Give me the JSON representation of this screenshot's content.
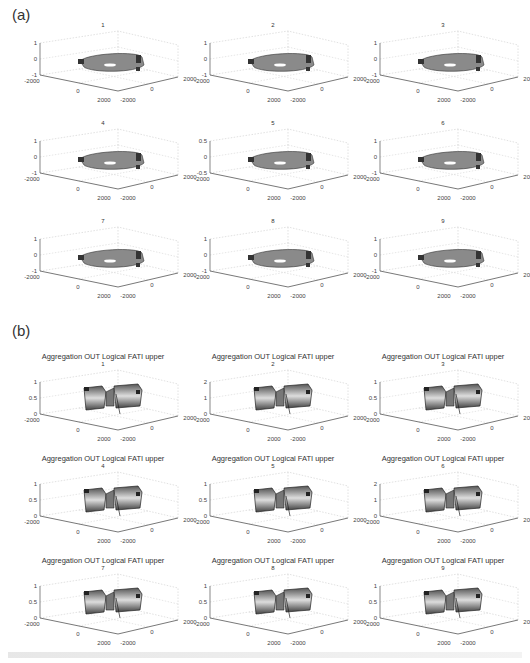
{
  "figure": {
    "panel_a_label": "(a)",
    "panel_b_label": "(b)",
    "panel_b_title": "Aggregation OUT Logical FATI upper",
    "xy_ticks": [
      "-2000",
      "0",
      "2000"
    ],
    "surface_labels": [
      "100",
      "50",
      "0"
    ]
  },
  "chart_data": [
    {
      "type": "surface3d",
      "group": "(a)",
      "panels": [
        {
          "title": "1",
          "zticks": [
            "1",
            "0",
            "-1"
          ],
          "xticks": [
            "-2000",
            "0",
            "2000"
          ],
          "yticks": [
            "-2000",
            "0",
            "2000"
          ]
        },
        {
          "title": "2",
          "zticks": [
            "1",
            "0",
            "-1"
          ],
          "xticks": [
            "-2000",
            "0",
            "2000"
          ],
          "yticks": [
            "-2000",
            "0",
            "2000"
          ]
        },
        {
          "title": "3",
          "zticks": [
            "1",
            "0",
            "-1"
          ],
          "xticks": [
            "-2000",
            "0",
            "2000"
          ],
          "yticks": [
            "-2000",
            "0",
            "2000"
          ]
        },
        {
          "title": "4",
          "zticks": [
            "1",
            "0",
            "-1"
          ],
          "xticks": [
            "-2000",
            "0",
            "2000"
          ],
          "yticks": [
            "-2000",
            "0",
            "2000"
          ]
        },
        {
          "title": "5",
          "zticks": [
            "0.5",
            "0",
            "-0.5"
          ],
          "xticks": [
            "-2000",
            "0",
            "2000"
          ],
          "yticks": [
            "-2000",
            "0",
            "2000"
          ]
        },
        {
          "title": "6",
          "zticks": [
            "1",
            "0",
            "-1"
          ],
          "xticks": [
            "-2000",
            "0",
            "2000"
          ],
          "yticks": [
            "-2000",
            "0",
            "2000"
          ]
        },
        {
          "title": "7",
          "zticks": [
            "1",
            "0",
            "-1"
          ],
          "xticks": [
            "-2000",
            "0",
            "2000"
          ],
          "yticks": [
            "-2000",
            "0",
            "2000"
          ]
        },
        {
          "title": "8",
          "zticks": [
            "1",
            "0",
            "-1"
          ],
          "xticks": [
            "-2000",
            "0",
            "2000"
          ],
          "yticks": [
            "-2000",
            "0",
            "2000"
          ]
        },
        {
          "title": "9",
          "zticks": [
            "1",
            "0",
            "-1"
          ],
          "xticks": [
            "-2000",
            "0",
            "2000"
          ],
          "yticks": [
            "-2000",
            "0",
            "2000"
          ]
        }
      ]
    },
    {
      "type": "surface3d",
      "group": "(b)",
      "title": "Aggregation OUT Logical FATI upper",
      "panels": [
        {
          "title": "1",
          "zticks": [
            "1",
            "0.5",
            "0"
          ]
        },
        {
          "title": "2",
          "zticks": [
            "2",
            "1",
            "0"
          ]
        },
        {
          "title": "3",
          "zticks": [
            "1",
            "0.5",
            "0"
          ]
        },
        {
          "title": "4",
          "zticks": [
            "1",
            "0.5",
            "0"
          ]
        },
        {
          "title": "5",
          "zticks": [
            "1",
            "0.5",
            "0"
          ]
        },
        {
          "title": "6",
          "zticks": [
            "2",
            "1",
            "0"
          ]
        },
        {
          "title": "7",
          "zticks": [
            "1",
            "0.5",
            "0"
          ]
        },
        {
          "title": "8",
          "zticks": [
            "1",
            "0.5",
            "0"
          ]
        },
        {
          "title": "9",
          "zticks": [
            "1",
            "0.5",
            "0"
          ]
        }
      ]
    }
  ]
}
